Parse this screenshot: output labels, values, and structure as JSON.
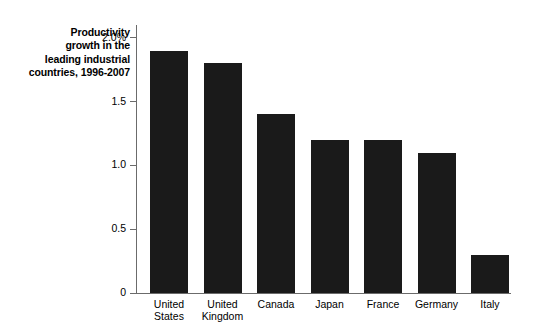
{
  "chart_data": {
    "type": "bar",
    "title": "Productivity growth in the leading industrial countries, 1996-2007",
    "title_lines": [
      "Productivity",
      "growth in the",
      "leading industrial",
      "countries, 1996-2007"
    ],
    "categories": [
      "United States",
      "United Kingdom",
      "Canada",
      "Japan",
      "France",
      "Germany",
      "Italy"
    ],
    "category_lines": [
      [
        "United",
        "States"
      ],
      [
        "United",
        "Kingdom"
      ],
      [
        "Canada"
      ],
      [
        "Japan"
      ],
      [
        "France"
      ],
      [
        "Germany"
      ],
      [
        "Italy"
      ]
    ],
    "values": [
      1.9,
      1.8,
      1.4,
      1.2,
      1.2,
      1.1,
      0.3
    ],
    "xlabel": "",
    "ylabel": "",
    "ylim": [
      0,
      2.1
    ],
    "yticks": [
      0,
      0.5,
      1.0,
      1.5,
      2.0
    ],
    "ytick_labels": [
      "0",
      "0.5",
      "1.0",
      "1.5",
      "2.0%"
    ],
    "units": "percent",
    "grid": false,
    "legend": null,
    "bar_color": "#1a1a1a",
    "axis_color": "#6b6b6b",
    "background_color": "#ffffff"
  }
}
